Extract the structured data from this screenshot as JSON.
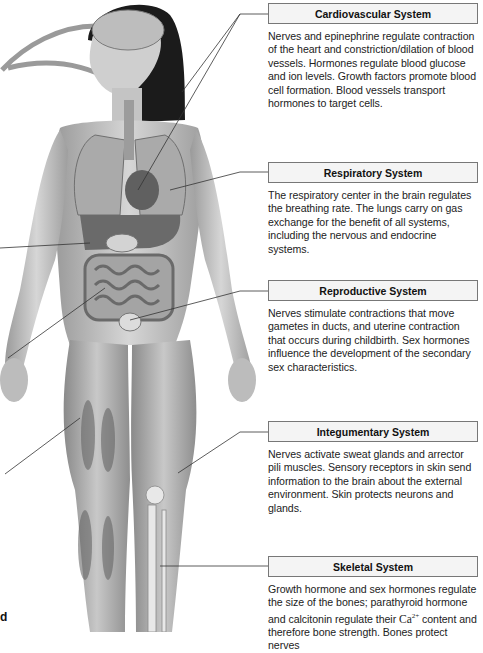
{
  "diagram": {
    "left_cut_label_fragment": "d",
    "panels": [
      {
        "title": "Cardiovascular System",
        "text": "Nerves and epinephrine regulate contraction of the heart and constriction/dilation of blood vessels. Hormones regulate blood glucose and ion levels. Growth factors promote blood cell formation. Blood vessels transport hormones to target cells."
      },
      {
        "title": "Respiratory System",
        "text": "The respiratory center in the brain regulates the breathing rate. The lungs carry on gas exchange for the benefit of all systems, including the nervous and endocrine systems."
      },
      {
        "title": "Reproductive System",
        "text": "Nerves stimulate contractions that move gametes in ducts, and uterine contraction that occurs during childbirth. Sex hormones influence the development of the secondary sex characteristics."
      },
      {
        "title": "Integumentary System",
        "text": "Nerves activate sweat glands and arrector pili muscles. Sensory receptors in skin send information to the brain about the external environment. Skin protects neurons and glands."
      },
      {
        "title": "Skeletal System",
        "text_before": "Growth hormone and sex hormones regulate the size of the bones; parathyroid hormone and calcitonin regulate their ",
        "chem": "Ca",
        "chem_sup": "2+",
        "text_after": " content and therefore bone strength. Bones protect nerves"
      }
    ],
    "colors": {
      "box_fill": "#f4f4f4",
      "box_border": "#777777",
      "leader_line": "#333333",
      "skin": "#c9c9c9",
      "hair": "#1b1b1b"
    }
  }
}
